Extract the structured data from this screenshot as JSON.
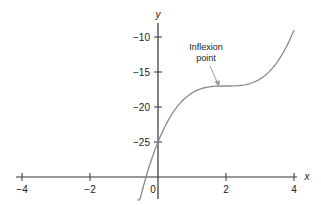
{
  "chart_data": {
    "type": "line",
    "title": "",
    "xlabel": "x",
    "ylabel": "y",
    "xlim": [
      -4,
      4
    ],
    "ylim": [
      -30,
      -8
    ],
    "x_axis_crosses_y_at": -30,
    "y_axis_crosses_x_at": 0,
    "grid": false,
    "legend": null,
    "x_ticks": [
      -4,
      -2,
      0,
      2,
      4
    ],
    "x_tick_labels": [
      "−4",
      "−2",
      "0",
      "2",
      "4"
    ],
    "y_ticks": [
      -10,
      -15,
      -20,
      -25
    ],
    "y_tick_labels": [
      "−10",
      "−15",
      "−20",
      "−25"
    ],
    "series": [
      {
        "name": "y = (x − 2)³ − 17",
        "color": "#8a8a8a",
        "x": [
          -0.6,
          -0.4,
          -0.2,
          0,
          0.25,
          0.5,
          0.75,
          1,
          1.25,
          1.5,
          1.75,
          2,
          2.25,
          2.5,
          2.75,
          3,
          3.25,
          3.5,
          3.75,
          4
        ],
        "y": [
          -34.58,
          -30.82,
          -27.65,
          -25,
          -22.36,
          -20.38,
          -18.95,
          -18,
          -17.42,
          -17.13,
          -17.02,
          -17,
          -16.98,
          -16.88,
          -16.58,
          -16,
          -15.05,
          -13.63,
          -11.64,
          -9
        ]
      }
    ],
    "annotations": [
      {
        "text_lines": [
          "Inflexion",
          "point"
        ],
        "points_to": {
          "x": 1.8,
          "y": -17.2
        },
        "arrow": true
      }
    ]
  },
  "labels": {
    "x_axis": "x",
    "y_axis": "y",
    "annotation_line1": "Inflexion",
    "annotation_line2": "point",
    "tick_x_m4": "−4",
    "tick_x_m2": "−2",
    "tick_x_0": "0",
    "tick_x_2": "2",
    "tick_x_4": "4",
    "tick_y_m10": "−10",
    "tick_y_m15": "−15",
    "tick_y_m20": "−20",
    "tick_y_m25": "−25"
  },
  "colors": {
    "axis": "#333333",
    "curve": "#8a8a8a",
    "arrow": "#9a9a9a",
    "text": "#222222"
  }
}
